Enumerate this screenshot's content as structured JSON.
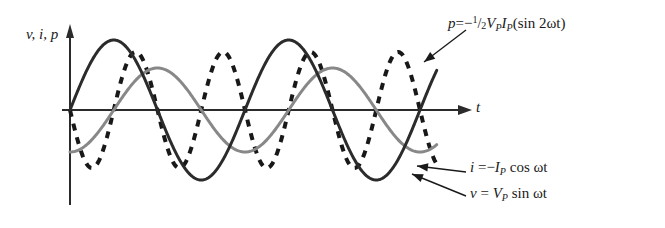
{
  "figure": {
    "axes": {
      "y_label": "v, i, p",
      "x_label": "t",
      "origin": [
        70,
        110
      ],
      "x_axis_end": 470,
      "y_axis_top": 27,
      "grid": false
    },
    "annotations": {
      "power": {
        "lhs": "p",
        "equals": "=",
        "sign": "−",
        "frac_num": "1",
        "frac_slash": "/",
        "frac_den": "2",
        "amp_v": "V",
        "amp_v_sub": "P",
        "amp_i": "I",
        "amp_i_sub": "P",
        "trig": "(sin 2ωt)"
      },
      "current": {
        "lhs": "i",
        "equals": "=",
        "sign": "−",
        "amp": "I",
        "amp_sub": "P",
        "trig": "cos ωt"
      },
      "voltage": {
        "lhs": "v",
        "equals": "=",
        "amp": "V",
        "amp_sub": "P",
        "trig": "sin ωt"
      }
    }
  },
  "chart_data": {
    "type": "line",
    "title": "",
    "xlabel": "t",
    "ylabel": "v, i, p",
    "grid": false,
    "legend": "inline-annotations",
    "x_range_px": [
      70,
      437
    ],
    "y_zero_px": 110,
    "series": [
      {
        "name": "v",
        "label": "v = V_P sin ωt",
        "color": "#2b2b2b",
        "style": "solid",
        "width": 3.0,
        "form": "A*sin(w*t)",
        "amplitude_px": 70,
        "period_px": 175,
        "phase_deg": 0,
        "peaks_px": [
          [
            113,
            40
          ],
          [
            288,
            40
          ]
        ],
        "troughs_px": [
          [
            201,
            180
          ],
          [
            376,
            180
          ]
        ],
        "zero_crossings_px": [
          70,
          157,
          245,
          332,
          420
        ]
      },
      {
        "name": "i",
        "label": "i = −I_P cos ωt",
        "color": "#888888",
        "style": "solid",
        "width": 3.0,
        "form": "-A*cos(w*t)",
        "amplitude_px": 42,
        "period_px": 175,
        "phase_deg": -90,
        "peaks_px": [
          [
            157,
            68
          ],
          [
            332,
            68
          ]
        ],
        "troughs_px": [
          [
            70,
            152
          ],
          [
            245,
            152
          ],
          [
            420,
            152
          ]
        ],
        "zero_crossings_px": [
          113,
          201,
          288,
          376
        ]
      },
      {
        "name": "p",
        "label": "p = −½V_P I_P (sin 2ωt)",
        "color": "#181818",
        "style": "dashed",
        "width": 4.0,
        "dash_px": [
          7,
          7
        ],
        "form": "-A*sin(2*w*t)",
        "amplitude_px": 58,
        "period_px": 87.5,
        "phase_deg": 180,
        "peaks_px": [
          [
            135,
            52
          ],
          [
            222,
            52
          ],
          [
            310,
            52
          ],
          [
            397,
            52
          ]
        ],
        "troughs_px": [
          [
            92,
            168
          ],
          [
            179,
            168
          ],
          [
            266,
            168
          ],
          [
            354,
            168
          ]
        ],
        "zero_crossings_px": [
          70,
          113,
          157,
          201,
          245,
          288,
          332,
          376,
          420
        ]
      }
    ],
    "leader_arrows": [
      {
        "for": "p",
        "from_px": [
          466,
          30
        ],
        "to_px": [
          424,
          62
        ]
      },
      {
        "for": "i",
        "from_px": [
          466,
          172
        ],
        "to_px": [
          417,
          166
        ]
      },
      {
        "for": "v",
        "from_px": [
          466,
          196
        ],
        "to_px": [
          412,
          174
        ]
      }
    ]
  }
}
